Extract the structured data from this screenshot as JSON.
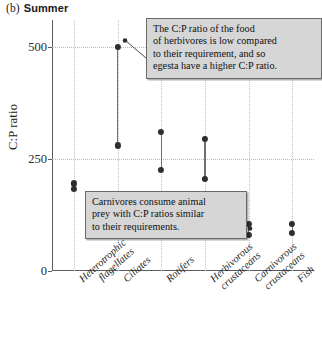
{
  "panel": {
    "label": "(b)",
    "title": "Summer"
  },
  "chart_data": {
    "type": "scatter",
    "title": "Summer",
    "panel_label": "(b)",
    "xlabel": "",
    "ylabel": "C:P ratio",
    "ylim": [
      0,
      560
    ],
    "yticks": [
      0,
      250,
      500
    ],
    "ytick_labels": [
      "0",
      "250",
      "500"
    ],
    "grid": "dotted both axes",
    "legend": "none",
    "categories": [
      "Heterotrophic flagellates",
      "Ciliates",
      "Rotifers",
      "Herbivorous crustaceans",
      "Carnivorous crustaceans",
      "Fish"
    ],
    "series": [
      {
        "name": "upper value (egesta / food C:P)",
        "values": [
          195,
          500,
          310,
          295,
          105,
          105
        ]
      },
      {
        "name": "lower value (requirement / body C:P)",
        "values": [
          183,
          280,
          225,
          205,
          80,
          85
        ]
      }
    ],
    "annotations": [
      {
        "id": "herbivore-note",
        "text": "The C:P ratio of the food of herbivores is low compared to their requirement, and so egesta have a higher C:P ratio.",
        "points_to": "Ciliates"
      },
      {
        "id": "carnivore-note",
        "text": "Carnivores consume animal prey with C:P ratios similar to their requirements.",
        "points_to": "Carnivorous crustaceans"
      }
    ]
  },
  "axis": {
    "y_title": "C:P ratio",
    "y_tick_0": "0",
    "y_tick_250": "250",
    "y_tick_500": "500"
  },
  "x_labels": [
    {
      "line1": "Heterotrophic",
      "line2": "flagellates"
    },
    {
      "line1": "Ciliates",
      "line2": ""
    },
    {
      "line1": "Rotifers",
      "line2": ""
    },
    {
      "line1": "Herbivorous",
      "line2": "crustaceans"
    },
    {
      "line1": "Carnivorous",
      "line2": "crustaceans"
    },
    {
      "line1": "Fish",
      "line2": ""
    }
  ],
  "callouts": {
    "herbivore": {
      "line1": "The C:P ratio of the food",
      "line2": "of herbivores is low compared",
      "line3": "to their requirement, and so",
      "line4": "egesta have a higher C:P ratio."
    },
    "carnivore": {
      "line1": "Carnivores consume animal",
      "line2": "prey with C:P ratios similar",
      "line3": "to their requirements."
    }
  },
  "colors": {
    "marker": "#2e2e2e",
    "connector": "#6f6f6f",
    "axis": "#5b5b5b",
    "grid": "#bdbdbd",
    "callout_bg": "#d6d6d6",
    "callout_border": "#6a6a6a"
  }
}
